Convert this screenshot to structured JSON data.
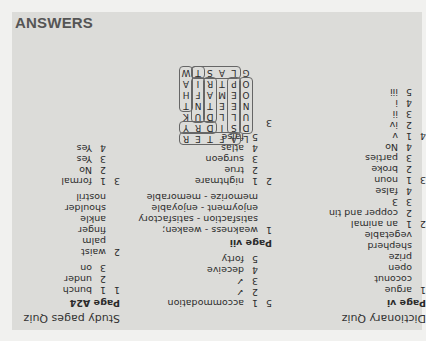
{
  "header": {
    "title": "ANSWERS"
  },
  "dictionary_quiz": {
    "title": "Dictionary Quiz",
    "page": "Page vi",
    "sections": [
      {
        "num": "1",
        "items": [
          {
            "n": "",
            "t": "argue"
          },
          {
            "n": "",
            "t": "coconut"
          },
          {
            "n": "",
            "t": "open"
          },
          {
            "n": "",
            "t": "prize"
          },
          {
            "n": "",
            "t": "shepherd"
          },
          {
            "n": "",
            "t": "vegetable"
          }
        ]
      },
      {
        "num": "2",
        "items": [
          {
            "n": "1",
            "t": "an animal"
          },
          {
            "n": "2",
            "t": "copper and tin"
          },
          {
            "n": "3",
            "t": "3"
          },
          {
            "n": "4",
            "t": "false"
          }
        ]
      },
      {
        "num": "3",
        "items": [
          {
            "n": "1",
            "t": "noun"
          },
          {
            "n": "2",
            "t": "broke"
          },
          {
            "n": "3",
            "t": "parties"
          },
          {
            "n": "4",
            "t": "No"
          }
        ]
      },
      {
        "num": "4",
        "items": [
          {
            "n": "1",
            "t": "v"
          },
          {
            "n": "2",
            "t": "iv"
          },
          {
            "n": "3",
            "t": "ii"
          },
          {
            "n": "4",
            "t": "i"
          },
          {
            "n": "5",
            "t": "iii"
          }
        ]
      }
    ]
  },
  "middle": {
    "section5": {
      "num": "5",
      "items": [
        {
          "n": "1",
          "t": "accommodation"
        },
        {
          "n": "2",
          "t": "✓"
        },
        {
          "n": "3",
          "t": "✓"
        },
        {
          "n": "4",
          "t": "deceive"
        },
        {
          "n": "5",
          "t": "forty"
        }
      ]
    },
    "page": "Page vii",
    "section1": {
      "num": "1",
      "items": [
        "weakness - weaken;",
        "satisfaction - satisfactory",
        "enjoyment - enjoyable",
        "memorize - memorable"
      ]
    },
    "section2": {
      "num": "2",
      "items": [
        {
          "n": "1",
          "t": "nightmare"
        },
        {
          "n": "2",
          "t": "true"
        },
        {
          "n": "3",
          "t": "surgeon"
        },
        {
          "n": "4",
          "t": "atlas"
        },
        {
          "n": "5",
          "t": "false"
        }
      ]
    },
    "section3": {
      "num": "3"
    },
    "grid": [
      [
        "L",
        "A",
        "F",
        "T",
        "E",
        "R"
      ],
      [
        "D",
        "S",
        "I",
        "D",
        "R",
        "Y"
      ],
      [
        "U",
        "L",
        "L",
        "D",
        "U",
        "K"
      ],
      [
        "N",
        "E",
        "E",
        "T",
        "N",
        "T"
      ],
      [
        "O",
        "E",
        "M",
        "A",
        "F",
        "H"
      ],
      [
        "O",
        "P",
        "T",
        "R",
        "I",
        "A"
      ],
      [
        "G",
        "L",
        "A",
        "S",
        "T",
        "W"
      ]
    ]
  },
  "study_pages_quiz": {
    "title": "Study pages Quiz",
    "page": "Page A24",
    "section1": {
      "num": "1",
      "items": [
        {
          "n": "1",
          "t": "bunch"
        },
        {
          "n": "2",
          "t": "under"
        },
        {
          "n": "3",
          "t": "on"
        }
      ]
    },
    "section2": {
      "num": "2",
      "items": [
        "waist",
        "palm",
        "finger",
        "ankle",
        "shoulder",
        "nostril"
      ]
    },
    "section3": {
      "num": "3",
      "items": [
        {
          "n": "1",
          "t": "formal"
        },
        {
          "n": "2",
          "t": "No"
        },
        {
          "n": "3",
          "t": "Yes"
        },
        {
          "n": "4",
          "t": "Yes"
        }
      ]
    }
  }
}
